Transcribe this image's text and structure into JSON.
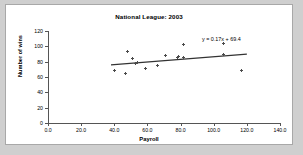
{
  "chart_data": {
    "type": "scatter",
    "title": "National League: 2003",
    "xlabel": "Payroll",
    "ylabel": "Number of wins",
    "xlim": [
      0,
      140
    ],
    "ylim": [
      0,
      120
    ],
    "xticks": [
      "0.0",
      "20.0",
      "40.0",
      "60.0",
      "80.0",
      "100.0",
      "120.0",
      "140.0"
    ],
    "yticks": [
      "0",
      "20",
      "40",
      "60",
      "80",
      "100",
      "120"
    ],
    "xtick_values": [
      0,
      20,
      40,
      60,
      80,
      100,
      120,
      140
    ],
    "ytick_values": [
      0,
      20,
      40,
      60,
      80,
      100,
      120
    ],
    "grid": false,
    "legend": "none",
    "annotations": [
      {
        "text": "y = 0.17x + 69.4",
        "role": "trendline-equation"
      }
    ],
    "trendline": {
      "slope": 0.17,
      "intercept": 69.4,
      "equation": "y = 0.17x + 69.4",
      "x_start": 38,
      "x_end": 120,
      "color": "#333333"
    },
    "series": [
      {
        "name": "NL teams 2003",
        "marker": "asterisk",
        "color": "#4a4a4a",
        "points": [
          {
            "x": 40,
            "y": 69
          },
          {
            "x": 47,
            "y": 65
          },
          {
            "x": 48,
            "y": 93
          },
          {
            "x": 51,
            "y": 84
          },
          {
            "x": 53,
            "y": 77
          },
          {
            "x": 54,
            "y": 79
          },
          {
            "x": 59,
            "y": 71
          },
          {
            "x": 66,
            "y": 75
          },
          {
            "x": 71,
            "y": 88
          },
          {
            "x": 78,
            "y": 86
          },
          {
            "x": 79,
            "y": 87
          },
          {
            "x": 82,
            "y": 86
          },
          {
            "x": 82,
            "y": 103
          },
          {
            "x": 106,
            "y": 104
          },
          {
            "x": 106,
            "y": 89
          },
          {
            "x": 117,
            "y": 69
          }
        ]
      }
    ]
  }
}
